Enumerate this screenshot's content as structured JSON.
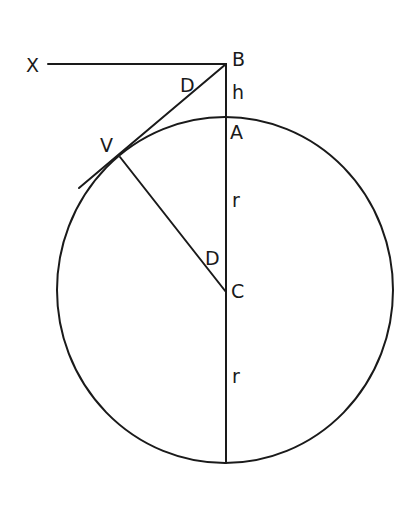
{
  "diagram": {
    "labels": {
      "X": "X",
      "B": "B",
      "h": "h",
      "A": "A",
      "V": "V",
      "D_upper": "D",
      "D_lower": "D",
      "r_upper": "r",
      "C": "C",
      "r_lower": "r"
    },
    "elements": [
      "circle with center C",
      "horizontal line X to B",
      "vertical line B through A and C to bottom of circle",
      "tangent line from B touching circle at V",
      "radius line V to C"
    ],
    "colors": {
      "stroke": "#1a1a1a",
      "background": "#ffffff"
    }
  }
}
